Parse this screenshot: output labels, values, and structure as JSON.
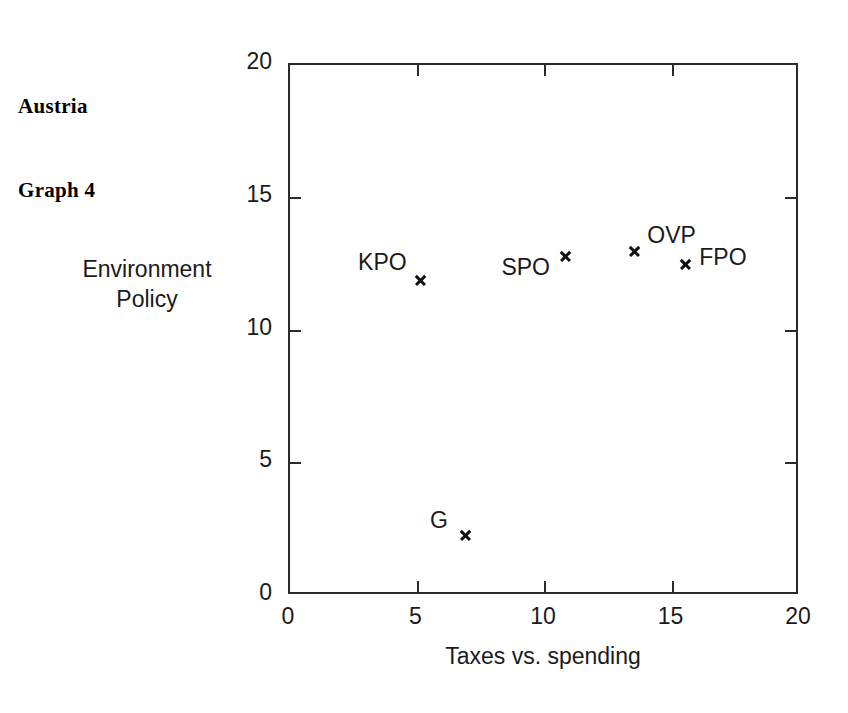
{
  "caption": {
    "line1": "Austria",
    "line2": "Graph 4"
  },
  "chart_data": {
    "type": "scatter",
    "title": "Austria Graph 4",
    "xlabel": "Taxes vs. spending",
    "ylabel_line1": "Environment",
    "ylabel_line2": "Policy",
    "ylabel": "Environment Policy",
    "xlim": [
      0,
      20
    ],
    "ylim": [
      0,
      20
    ],
    "xticks": [
      "0",
      "5",
      "10",
      "15",
      "20"
    ],
    "yticks": [
      "0",
      "5",
      "10",
      "15",
      "20"
    ],
    "xtick_values": [
      0,
      5,
      10,
      15,
      20
    ],
    "ytick_values": [
      0,
      5,
      10,
      15,
      20
    ],
    "grid": false,
    "legend": "none",
    "marker_style": "x",
    "points": [
      {
        "label": "KPO",
        "x": 5.1,
        "y": 11.9,
        "label_pos": "left"
      },
      {
        "label": "G",
        "x": 6.9,
        "y": 2.3,
        "label_pos": "left"
      },
      {
        "label": "SPO",
        "x": 10.8,
        "y": 12.8,
        "label_pos": "below-left"
      },
      {
        "label": "OVP",
        "x": 13.5,
        "y": 13.0,
        "label_pos": "right-above"
      },
      {
        "label": "FPO",
        "x": 15.5,
        "y": 12.5,
        "label_pos": "right"
      }
    ]
  },
  "colors": {
    "axis": "#2b2b2b",
    "text": "#1a1a1a",
    "marker": "#111111",
    "background": "#ffffff"
  }
}
